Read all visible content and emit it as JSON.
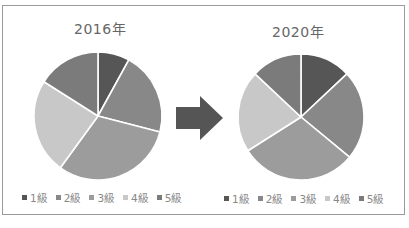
{
  "caption_cutoff": "図表：1級～5級の構成比の変化",
  "chart_data": [
    {
      "type": "pie",
      "title": "2016年",
      "categories": [
        "1級",
        "2級",
        "3級",
        "4級",
        "5級"
      ],
      "values": [
        8,
        21,
        31,
        24,
        16
      ],
      "unit": "%",
      "start_angle_deg": 0,
      "direction": "clockwise",
      "legend_position": "bottom"
    },
    {
      "type": "pie",
      "title": "2020年",
      "categories": [
        "1級",
        "2級",
        "3級",
        "4級",
        "5級"
      ],
      "values": [
        13,
        23,
        30,
        21,
        13
      ],
      "unit": "%",
      "start_angle_deg": 0,
      "direction": "clockwise",
      "legend_position": "bottom"
    }
  ],
  "series_colors": [
    "#565656",
    "#888888",
    "#9c9c9c",
    "#c8c8c8",
    "#7b7b7b"
  ],
  "legend": {
    "labels": [
      "1級",
      "2級",
      "3級",
      "4級",
      "5級"
    ]
  },
  "arrow": {
    "icon": "right-arrow-icon",
    "color": "#555555"
  },
  "pies": [
    {
      "cx": 98,
      "cy": 116,
      "r": 64
    },
    {
      "cx": 301,
      "cy": 117,
      "r": 63
    }
  ]
}
